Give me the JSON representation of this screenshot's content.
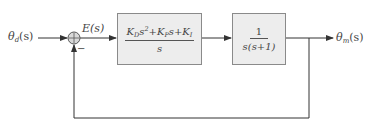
{
  "diagram": {
    "type": "block-diagram",
    "input": {
      "symbol": "θ",
      "subscript": "d",
      "arg": "(s)"
    },
    "output": {
      "symbol": "θ",
      "subscript": "m",
      "arg": "(s)"
    },
    "error_signal": "E(s)",
    "summing_junction": {
      "plus_sign": "+",
      "minus_sign": "−"
    },
    "controller_block": {
      "numerator": {
        "t1_coef": "K",
        "t1_sub": "D",
        "t1_var": "s",
        "t1_exp": "2",
        "plus1": "+",
        "t2_coef": "K",
        "t2_sub": "P",
        "t2_var": "s",
        "plus2": "+",
        "t3_coef": "K",
        "t3_sub": "I"
      },
      "denominator": "s"
    },
    "plant_block": {
      "numerator": "1",
      "denominator": "s(s+1)"
    },
    "feedback": "unity negative feedback",
    "colors": {
      "line": "#333333",
      "block_fill": "#ededed",
      "block_border": "#8a8a8a",
      "junction_fill": "#d9d9d9"
    }
  }
}
